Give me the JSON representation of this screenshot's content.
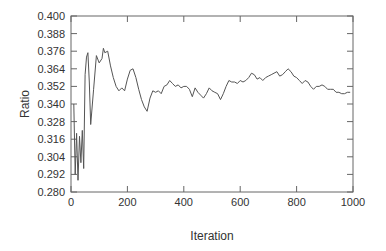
{
  "chart_data": {
    "type": "line",
    "title": "",
    "xlabel": "Iteration",
    "ylabel": "Ratio",
    "xlim": [
      0,
      1000
    ],
    "ylim": [
      0.28,
      0.4
    ],
    "xticks": [
      "0",
      "200",
      "400",
      "600",
      "800",
      "1000"
    ],
    "yticks": [
      "0.280",
      "0.292",
      "0.304",
      "0.316",
      "0.328",
      "0.340",
      "0.352",
      "0.364",
      "0.376",
      "0.388",
      "0.400"
    ],
    "grid": false,
    "legend": null,
    "series": [
      {
        "name": "Ratio",
        "color": "#555555",
        "x": [
          10,
          15,
          20,
          25,
          30,
          35,
          40,
          45,
          50,
          55,
          60,
          65,
          70,
          80,
          90,
          100,
          110,
          115,
          120,
          130,
          140,
          150,
          160,
          170,
          180,
          190,
          200,
          210,
          220,
          230,
          240,
          250,
          260,
          270,
          280,
          290,
          300,
          310,
          320,
          330,
          340,
          350,
          360,
          370,
          380,
          390,
          400,
          410,
          420,
          430,
          440,
          450,
          460,
          470,
          480,
          490,
          500,
          510,
          520,
          530,
          540,
          550,
          560,
          570,
          580,
          590,
          600,
          610,
          620,
          630,
          640,
          650,
          660,
          670,
          680,
          690,
          700,
          710,
          720,
          730,
          740,
          750,
          760,
          770,
          780,
          790,
          800,
          810,
          820,
          830,
          840,
          850,
          860,
          870,
          880,
          890,
          900,
          910,
          920,
          930,
          940,
          950,
          960,
          970,
          980,
          990
        ],
        "values": [
          0.34,
          0.292,
          0.32,
          0.288,
          0.318,
          0.3,
          0.322,
          0.296,
          0.36,
          0.372,
          0.375,
          0.355,
          0.326,
          0.35,
          0.373,
          0.368,
          0.371,
          0.378,
          0.375,
          0.376,
          0.366,
          0.358,
          0.352,
          0.349,
          0.351,
          0.349,
          0.357,
          0.363,
          0.364,
          0.358,
          0.35,
          0.343,
          0.338,
          0.335,
          0.344,
          0.349,
          0.348,
          0.349,
          0.347,
          0.352,
          0.353,
          0.356,
          0.354,
          0.352,
          0.353,
          0.351,
          0.352,
          0.352,
          0.35,
          0.345,
          0.351,
          0.348,
          0.346,
          0.344,
          0.347,
          0.351,
          0.349,
          0.348,
          0.347,
          0.343,
          0.347,
          0.352,
          0.356,
          0.355,
          0.355,
          0.354,
          0.356,
          0.355,
          0.356,
          0.358,
          0.361,
          0.36,
          0.357,
          0.358,
          0.356,
          0.358,
          0.359,
          0.36,
          0.361,
          0.362,
          0.359,
          0.36,
          0.362,
          0.364,
          0.362,
          0.359,
          0.358,
          0.356,
          0.354,
          0.356,
          0.355,
          0.352,
          0.35,
          0.352,
          0.352,
          0.353,
          0.352,
          0.35,
          0.35,
          0.35,
          0.348,
          0.348,
          0.347,
          0.347,
          0.348,
          0.348
        ]
      }
    ]
  }
}
